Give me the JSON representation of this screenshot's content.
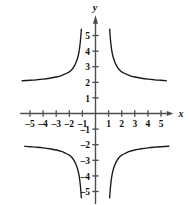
{
  "chart_data": {
    "type": "line",
    "title": "",
    "xlabel": "x",
    "ylabel": "y",
    "xlim": [
      -5.8,
      5.8
    ],
    "ylim": [
      -5.8,
      5.8
    ],
    "grid": false,
    "legend": false,
    "x_ticks": [
      -5,
      -4,
      -3,
      -2,
      -1,
      1,
      2,
      3,
      4,
      5
    ],
    "x_tick_labels": [
      "-5",
      "-4",
      "-3",
      "-2",
      "-1",
      "1",
      "2",
      "3",
      "4",
      "5"
    ],
    "y_ticks": [
      5,
      4,
      3,
      2,
      1,
      -1,
      -2,
      -3,
      -4,
      -5
    ],
    "y_tick_labels": [
      "5",
      "4",
      "3",
      "2",
      "1",
      "-1",
      "-2",
      "-3",
      "-4",
      "-5"
    ],
    "asymptotes": {
      "vertical": [
        -1,
        1
      ],
      "horizontal": [
        -2,
        2
      ]
    },
    "series": [
      {
        "name": "branch-upper-left",
        "quadrant": "upper-left",
        "points": [
          [
            -5.6,
            2.1
          ],
          [
            -5.0,
            2.13
          ],
          [
            -4.5,
            2.16
          ],
          [
            -4.0,
            2.2
          ],
          [
            -3.5,
            2.26
          ],
          [
            -3.0,
            2.34
          ],
          [
            -2.6,
            2.43
          ],
          [
            -2.3,
            2.54
          ],
          [
            -2.0,
            2.67
          ],
          [
            -1.8,
            2.82
          ],
          [
            -1.6,
            3.07
          ],
          [
            -1.45,
            3.35
          ],
          [
            -1.33,
            3.67
          ],
          [
            -1.24,
            4.05
          ],
          [
            -1.17,
            4.5
          ],
          [
            -1.12,
            4.95
          ],
          [
            -1.08,
            5.4
          ]
        ]
      },
      {
        "name": "branch-upper-right",
        "quadrant": "upper-right",
        "points": [
          [
            1.08,
            5.4
          ],
          [
            1.12,
            4.95
          ],
          [
            1.17,
            4.5
          ],
          [
            1.24,
            4.05
          ],
          [
            1.33,
            3.67
          ],
          [
            1.45,
            3.35
          ],
          [
            1.6,
            3.07
          ],
          [
            1.8,
            2.82
          ],
          [
            2.0,
            2.67
          ],
          [
            2.3,
            2.54
          ],
          [
            2.6,
            2.43
          ],
          [
            3.0,
            2.34
          ],
          [
            3.5,
            2.26
          ],
          [
            4.0,
            2.2
          ],
          [
            4.5,
            2.16
          ],
          [
            5.0,
            2.13
          ],
          [
            5.4,
            2.1
          ]
        ]
      },
      {
        "name": "branch-lower-left",
        "quadrant": "lower-left",
        "points": [
          [
            -5.4,
            -2.1
          ],
          [
            -5.0,
            -2.13
          ],
          [
            -4.5,
            -2.16
          ],
          [
            -4.0,
            -2.2
          ],
          [
            -3.5,
            -2.26
          ],
          [
            -3.0,
            -2.34
          ],
          [
            -2.6,
            -2.43
          ],
          [
            -2.3,
            -2.54
          ],
          [
            -2.0,
            -2.67
          ],
          [
            -1.8,
            -2.82
          ],
          [
            -1.6,
            -3.07
          ],
          [
            -1.45,
            -3.35
          ],
          [
            -1.33,
            -3.67
          ],
          [
            -1.24,
            -4.05
          ],
          [
            -1.17,
            -4.5
          ],
          [
            -1.12,
            -4.95
          ],
          [
            -1.08,
            -5.4
          ]
        ]
      },
      {
        "name": "branch-lower-right",
        "quadrant": "lower-right",
        "points": [
          [
            1.08,
            -5.4
          ],
          [
            1.12,
            -4.95
          ],
          [
            1.17,
            -4.5
          ],
          [
            1.24,
            -4.05
          ],
          [
            1.33,
            -3.67
          ],
          [
            1.45,
            -3.35
          ],
          [
            1.6,
            -3.07
          ],
          [
            1.8,
            -2.82
          ],
          [
            2.0,
            -2.67
          ],
          [
            2.3,
            -2.54
          ],
          [
            2.6,
            -2.43
          ],
          [
            3.0,
            -2.34
          ],
          [
            3.5,
            -2.26
          ],
          [
            4.0,
            -2.2
          ],
          [
            4.5,
            -2.16
          ],
          [
            5.0,
            -2.13
          ],
          [
            5.6,
            -2.1
          ]
        ]
      }
    ],
    "colors": {
      "curve": "#1a1a1a",
      "axis": "#4d4d4d",
      "background": "#ffffff"
    }
  }
}
